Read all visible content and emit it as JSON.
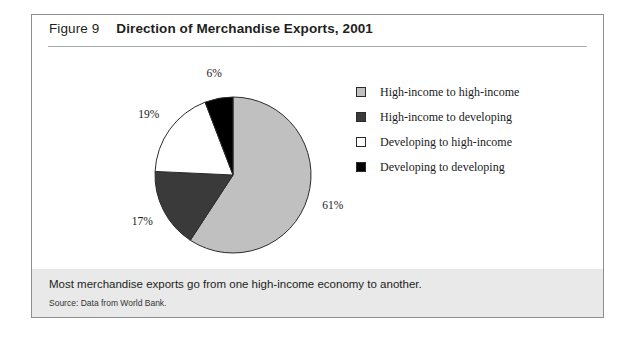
{
  "figure": {
    "number_label": "Figure 9",
    "title": "Direction of Merchandise Exports, 2001",
    "caption": "Most merchandise exports go from one high-income economy to another.",
    "source": "Source: Data from World Bank."
  },
  "colors": {
    "high_to_high": "#c0c0c0",
    "high_to_developing": "#3a3a3a",
    "developing_to_high": "#ffffff",
    "developing_to_developing": "#000000",
    "outline": "#2b2b2b",
    "frame_border": "#8d8f92",
    "footer_band": "#e9e9e9",
    "rule": "#a8abae"
  },
  "legend": {
    "items": [
      {
        "label": "High-income to high-income",
        "color": "#c0c0c0"
      },
      {
        "label": "High-income to developing",
        "color": "#3a3a3a"
      },
      {
        "label": "Developing to high-income",
        "color": "#ffffff"
      },
      {
        "label": "Developing to developing",
        "color": "#000000"
      }
    ]
  },
  "chart_data": {
    "type": "pie",
    "title": "Direction of Merchandise Exports, 2001",
    "xlabel": "",
    "ylabel": "",
    "legend_position": "right",
    "start_angle_deg": 0,
    "direction": "clockwise",
    "categories": [
      "High-income to high-income",
      "High-income to developing",
      "Developing to high-income",
      "Developing to developing"
    ],
    "values": [
      61,
      17,
      19,
      6
    ],
    "value_labels": [
      "61%",
      "17%",
      "19%",
      "6%"
    ],
    "units": "percent",
    "colors": [
      "#c0c0c0",
      "#3a3a3a",
      "#ffffff",
      "#000000"
    ],
    "annotations": [
      "Most merchandise exports go from one high-income economy to another."
    ]
  }
}
